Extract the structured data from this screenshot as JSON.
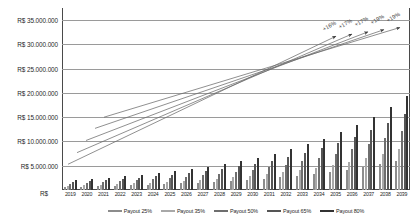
{
  "chart_data": {
    "type": "bar",
    "title": "",
    "xlabel": "",
    "ylabel": "",
    "currency_prefix": "R$",
    "ylim": [
      0,
      37500000
    ],
    "grid": true,
    "legend_position": "bottom",
    "baseline_label": "R$",
    "ytick_labels": [
      "R$ 35.000.000",
      "R$ 30.000.000",
      "R$ 25.000.000",
      "R$ 20.000.000",
      "R$ 15.000.000",
      "R$ 10.000.000",
      "R$ 5.000.000"
    ],
    "ytick_values": [
      35000000,
      30000000,
      25000000,
      20000000,
      15000000,
      10000000,
      5000000
    ],
    "categories": [
      "2019",
      "2020",
      "2021",
      "2022",
      "2023",
      "2024",
      "2025",
      "2026",
      "2027",
      "2028",
      "2029",
      "2030",
      "2031",
      "2032",
      "2033",
      "2034",
      "2035",
      "2036",
      "2037",
      "2038",
      "2039"
    ],
    "series": [
      {
        "name": "Payout 25%",
        "color": "#8c8c8c",
        "values": [
          620000,
          700000,
          790000,
          880000,
          980000,
          1090000,
          1210000,
          1350000,
          1500000,
          1680000,
          1870000,
          2090000,
          2340000,
          2620000,
          2940000,
          3300000,
          3710000,
          4180000,
          4720000,
          5340000,
          6050000
        ]
      },
      {
        "name": "Payout 35%",
        "color": "#a8a8a8",
        "values": [
          870000,
          980000,
          1100000,
          1230000,
          1380000,
          1530000,
          1700000,
          1890000,
          2100000,
          2350000,
          2620000,
          2930000,
          3280000,
          3670000,
          4120000,
          4620000,
          5200000,
          5860000,
          6610000,
          7470000,
          8470000
        ]
      },
      {
        "name": "Payout 50%",
        "color": "#6e6e6e",
        "values": [
          1240000,
          1400000,
          1570000,
          1760000,
          1970000,
          2190000,
          2430000,
          2700000,
          3000000,
          3350000,
          3740000,
          4180000,
          4680000,
          5240000,
          5880000,
          6600000,
          7420000,
          8370000,
          9450000,
          10680000,
          12100000
        ]
      },
      {
        "name": "Payout 65%",
        "color": "#555555",
        "values": [
          1610000,
          1820000,
          2040000,
          2290000,
          2560000,
          2840000,
          3160000,
          3510000,
          3900000,
          4360000,
          4860000,
          5430000,
          6080000,
          6810000,
          7640000,
          8580000,
          9650000,
          10880000,
          12280000,
          13890000,
          15730000
        ]
      },
      {
        "name": "Payout 80%",
        "color": "#333333",
        "values": [
          1980000,
          2240000,
          2510000,
          2810000,
          3150000,
          3500000,
          3890000,
          4320000,
          4800000,
          5360000,
          5980000,
          6680000,
          7480000,
          8380000,
          9410000,
          10560000,
          11880000,
          13390000,
          15120000,
          17090000,
          19360000
        ]
      }
    ],
    "trend_annotations": [
      {
        "label": "+16%"
      },
      {
        "label": "+17%"
      },
      {
        "label": "+17%"
      },
      {
        "label": "+19%"
      },
      {
        "label": "+19%"
      }
    ]
  }
}
